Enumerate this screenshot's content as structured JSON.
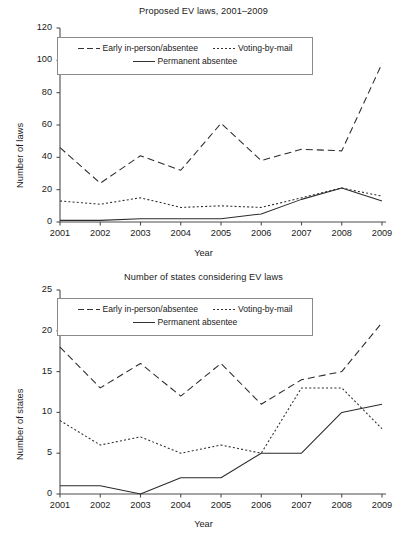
{
  "figure": {
    "xlabel": "Year",
    "legend": {
      "series1": "Early in-person/absentee",
      "series2": "Voting-by-mail",
      "series3": "Permanent absentee"
    }
  },
  "chart_data": [
    {
      "type": "line",
      "id": "proposed-ev-laws",
      "title": "Proposed EV laws, 2001–2009",
      "xlabel": "Year",
      "ylabel": "Number of laws",
      "categories": [
        "2001",
        "2002",
        "2003",
        "2004",
        "2005",
        "2006",
        "2007",
        "2008",
        "2009"
      ],
      "x": [
        2001,
        2002,
        2003,
        2004,
        2005,
        2006,
        2007,
        2008,
        2009
      ],
      "xlim": [
        2001,
        2009
      ],
      "ylim": [
        0,
        120
      ],
      "yticks": [
        0,
        20,
        40,
        60,
        80,
        100,
        120
      ],
      "grid": false,
      "legend_position": "top-left-inside",
      "series": [
        {
          "name": "Early in-person/absentee",
          "style": "dashed",
          "values": [
            46,
            24,
            41,
            32,
            61,
            38,
            45,
            44,
            98
          ]
        },
        {
          "name": "Voting-by-mail",
          "style": "dotted",
          "values": [
            13,
            11,
            15,
            9,
            10,
            9,
            15,
            21,
            16
          ]
        },
        {
          "name": "Permanent absentee",
          "style": "solid",
          "values": [
            1,
            1,
            2,
            2,
            2,
            5,
            14,
            21,
            13
          ]
        }
      ]
    },
    {
      "type": "line",
      "id": "states-considering-ev-laws",
      "title": "Number of states considering EV laws",
      "xlabel": "Year",
      "ylabel": "Number of states",
      "categories": [
        "2001",
        "2002",
        "2003",
        "2004",
        "2005",
        "2006",
        "2007",
        "2008",
        "2009"
      ],
      "x": [
        2001,
        2002,
        2003,
        2004,
        2005,
        2006,
        2007,
        2008,
        2009
      ],
      "xlim": [
        2001,
        2009
      ],
      "ylim": [
        0,
        25
      ],
      "yticks": [
        0,
        5,
        10,
        15,
        20,
        25
      ],
      "grid": false,
      "legend_position": "top-left-inside",
      "series": [
        {
          "name": "Early in-person/absentee",
          "style": "dashed",
          "values": [
            18,
            13,
            16,
            12,
            16,
            11,
            14,
            15,
            21
          ]
        },
        {
          "name": "Voting-by-mail",
          "style": "dotted",
          "values": [
            9,
            6,
            7,
            5,
            6,
            5,
            13,
            13,
            8
          ]
        },
        {
          "name": "Permanent absentee",
          "style": "solid",
          "values": [
            1,
            1,
            0,
            2,
            2,
            5,
            5,
            10,
            11
          ]
        }
      ]
    }
  ]
}
